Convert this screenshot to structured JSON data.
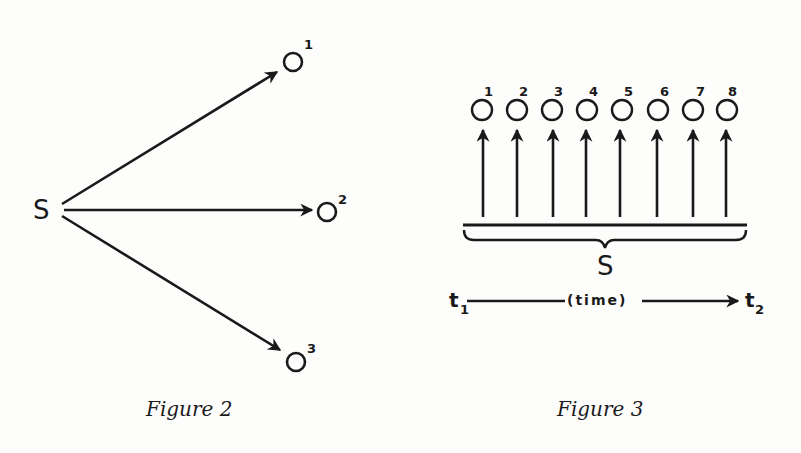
{
  "figure2": {
    "caption": "Figure 2",
    "source": {
      "label": "S"
    },
    "targets": [
      {
        "label": "O",
        "superscript": "1"
      },
      {
        "label": "O",
        "superscript": "2"
      },
      {
        "label": "O",
        "superscript": "3"
      }
    ]
  },
  "figure3": {
    "caption": "Figure 3",
    "outcomes": [
      "1",
      "2",
      "3",
      "4",
      "5",
      "6",
      "7",
      "8"
    ],
    "source": {
      "label": "S"
    },
    "timeline": {
      "label": "(time)",
      "start": {
        "label": "t",
        "subscript": "1"
      },
      "end": {
        "label": "t",
        "subscript": "2"
      }
    }
  },
  "colors": {
    "ink": "#1a1a1a",
    "paper": "#fdfdfc"
  }
}
